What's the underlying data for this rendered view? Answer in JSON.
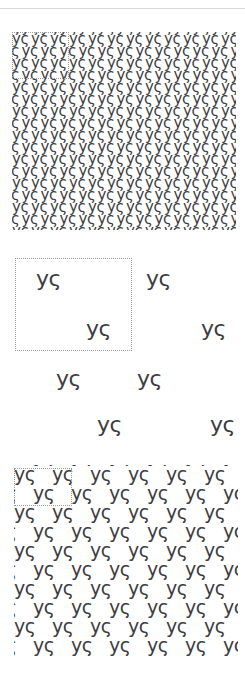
{
  "document": {
    "title": "Pattern Swatches",
    "background_color": "#ffffff",
    "width": 245,
    "height": 680,
    "top_rule_color": "#d7d9dd"
  },
  "glyph": {
    "text": "yς",
    "description": "lowercase-y followed by greek-lunate-sigma",
    "color": "#3d3d42"
  },
  "tile_box": {
    "style": "dotted",
    "color": "#9aa0a6",
    "label": "tile-boundary"
  },
  "panels": [
    {
      "id": "dense",
      "name": "dense-pattern-swatch",
      "glyph_size_px": 15,
      "pitch_x": 19,
      "pitch_y": 12,
      "stagger_x": 9.5,
      "columns": 13,
      "rows": 17,
      "tile_box": {
        "x": 0,
        "y": 0,
        "width": 57,
        "height": 47
      }
    },
    {
      "id": "sparse",
      "name": "sparse-pattern-swatch",
      "glyph_size_px": 22,
      "pitch_x": 100,
      "pitch_y": 50,
      "stagger_x": 50,
      "columns": 3,
      "rows": 4,
      "tile_box": {
        "x": 1,
        "y": 2,
        "width": 117,
        "height": 93
      },
      "positions": [
        {
          "x": 22,
          "y": 12
        },
        {
          "x": 132,
          "y": 12
        },
        {
          "x": 72,
          "y": 62
        },
        {
          "x": 187,
          "y": 62
        },
        {
          "x": 42,
          "y": 112
        },
        {
          "x": 123,
          "y": 112
        },
        {
          "x": 83,
          "y": 158
        },
        {
          "x": 196,
          "y": 158
        }
      ]
    },
    {
      "id": "medium",
      "name": "medium-pattern-swatch",
      "glyph_size_px": 19,
      "pitch_x": 38,
      "pitch_y": 19,
      "stagger_x": 19,
      "columns": 7,
      "rows": 11,
      "tile_box": {
        "x": 0,
        "y": 3,
        "width": 58,
        "height": 38
      }
    }
  ]
}
